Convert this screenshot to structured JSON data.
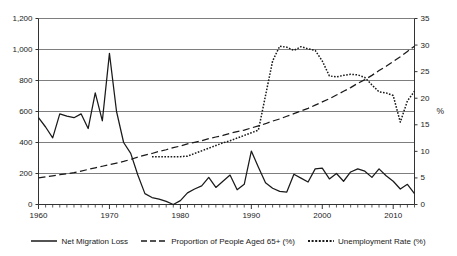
{
  "chart_data": {
    "type": "line",
    "title": "",
    "xlabel": "",
    "ylabel": "",
    "ylabel_right": "%",
    "grid": true,
    "legend_position": "bottom",
    "x": [
      1960,
      1961,
      1962,
      1963,
      1964,
      1965,
      1966,
      1967,
      1968,
      1969,
      1970,
      1971,
      1972,
      1973,
      1974,
      1975,
      1976,
      1977,
      1978,
      1979,
      1980,
      1981,
      1982,
      1983,
      1984,
      1985,
      1986,
      1987,
      1988,
      1989,
      1990,
      1991,
      1992,
      1993,
      1994,
      1995,
      1996,
      1997,
      1998,
      1999,
      2000,
      2001,
      2002,
      2003,
      2004,
      2005,
      2006,
      2007,
      2008,
      2009,
      2010,
      2011,
      2012,
      2013
    ],
    "xlim": [
      1960,
      2013
    ],
    "xticks": [
      1960,
      1970,
      1980,
      1990,
      2000,
      2010
    ],
    "xtick_labels": [
      "1960",
      "1970",
      "1980",
      "1990",
      "2000",
      "2010"
    ],
    "axes": [
      {
        "id": "left",
        "label": "",
        "ylim": [
          0,
          1200
        ],
        "yticks": [
          0,
          200,
          400,
          600,
          800,
          1000,
          1200
        ],
        "ytick_labels": [
          "0",
          "200",
          "400",
          "600",
          "800",
          "1,000",
          "1,200"
        ]
      },
      {
        "id": "right",
        "label": "%",
        "ylim": [
          0,
          35
        ],
        "yticks": [
          0,
          5,
          10,
          15,
          20,
          25,
          30,
          35
        ],
        "ytick_labels": [
          "0",
          "5",
          "10",
          "15",
          "20",
          "25",
          "30",
          "35"
        ]
      }
    ],
    "series": [
      {
        "name": "Net Migration Loss",
        "axis": "left",
        "style": "solid",
        "color": "#1a1a1a",
        "x": [
          1960,
          1961,
          1962,
          1963,
          1964,
          1965,
          1966,
          1967,
          1968,
          1969,
          1970,
          1971,
          1972,
          1973,
          1974,
          1975,
          1976,
          1977,
          1978,
          1979,
          1980,
          1981,
          1982,
          1983,
          1984,
          1985,
          1986,
          1987,
          1988,
          1989,
          1990,
          1991,
          1992,
          1993,
          1994,
          1995,
          1996,
          1997,
          1998,
          1999,
          2000,
          2001,
          2002,
          2003,
          2004,
          2005,
          2006,
          2007,
          2008,
          2009,
          2010,
          2011,
          2012,
          2013
        ],
        "values": [
          560,
          500,
          430,
          585,
          570,
          560,
          585,
          490,
          720,
          540,
          975,
          600,
          400,
          330,
          190,
          70,
          45,
          35,
          20,
          0,
          25,
          75,
          100,
          120,
          175,
          110,
          150,
          190,
          95,
          130,
          345,
          240,
          140,
          105,
          85,
          80,
          195,
          170,
          145,
          230,
          235,
          165,
          200,
          150,
          210,
          230,
          215,
          175,
          230,
          185,
          150,
          100,
          130,
          70
        ]
      },
      {
        "name": "Proportion of People Aged 65+ (%)",
        "axis": "right",
        "style": "dashed",
        "color": "#1a1a1a",
        "x": [
          1960,
          1961,
          1962,
          1963,
          1964,
          1965,
          1966,
          1967,
          1968,
          1969,
          1970,
          1971,
          1972,
          1973,
          1974,
          1975,
          1976,
          1977,
          1978,
          1979,
          1980,
          1981,
          1982,
          1983,
          1984,
          1985,
          1986,
          1987,
          1988,
          1989,
          1990,
          1991,
          1992,
          1993,
          1994,
          1995,
          1996,
          1997,
          1998,
          1999,
          2000,
          2001,
          2002,
          2003,
          2004,
          2005,
          2006,
          2007,
          2008,
          2009,
          2010,
          2011,
          2012,
          2013
        ],
        "values": [
          5.0,
          5.2,
          5.4,
          5.6,
          5.8,
          6.0,
          6.3,
          6.6,
          6.9,
          7.2,
          7.5,
          7.8,
          8.1,
          8.5,
          8.9,
          9.3,
          9.6,
          10.0,
          10.3,
          10.7,
          11.0,
          11.4,
          11.7,
          12.0,
          12.4,
          12.7,
          13.0,
          13.4,
          13.7,
          14.0,
          14.4,
          14.8,
          15.2,
          15.7,
          16.1,
          16.6,
          17.1,
          17.6,
          18.1,
          18.7,
          19.3,
          19.9,
          20.6,
          21.3,
          22.0,
          22.8,
          23.5,
          24.3,
          25.2,
          26.0,
          26.9,
          27.8,
          28.8,
          29.8
        ]
      },
      {
        "name": "Unemployment Rate (%)",
        "axis": "right",
        "style": "dotted",
        "color": "#1a1a1a",
        "x": [
          1976,
          1977,
          1978,
          1979,
          1980,
          1981,
          1982,
          1983,
          1984,
          1985,
          1986,
          1987,
          1988,
          1989,
          1990,
          1991,
          1992,
          1993,
          1994,
          1995,
          1996,
          1997,
          1998,
          1999,
          2000,
          2001,
          2002,
          2003,
          2004,
          2005,
          2006,
          2007,
          2008,
          2009,
          2010,
          2011,
          2012,
          2013
        ],
        "values": [
          9.0,
          9.0,
          9.0,
          9.0,
          9.0,
          9.1,
          9.6,
          10.1,
          10.6,
          11.1,
          11.6,
          12.0,
          12.5,
          13.0,
          13.5,
          14.0,
          20.5,
          27.0,
          29.8,
          29.6,
          29.0,
          29.7,
          29.3,
          29.0,
          27.0,
          24.2,
          24.0,
          24.3,
          24.5,
          24.4,
          23.9,
          22.5,
          21.2,
          21.0,
          20.5,
          15.5,
          19.5,
          21.3
        ]
      }
    ]
  },
  "legend": {
    "items": [
      {
        "label": "Net Migration Loss",
        "style": "solid"
      },
      {
        "label": "Proportion of People Aged 65+ (%)",
        "style": "dashed"
      },
      {
        "label": "Unemployment Rate (%)",
        "style": "dotted"
      }
    ]
  }
}
